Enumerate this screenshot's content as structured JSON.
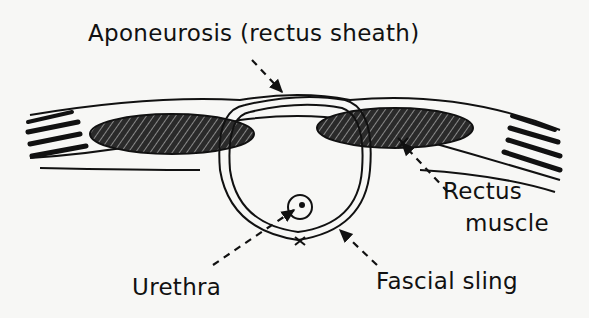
{
  "diagram": {
    "type": "anatomical-illustration",
    "labels": {
      "aponeurosis": "Aponeurosis (rectus sheath)",
      "rectus_line1": "Rectus",
      "rectus_line2": "muscle",
      "urethra": "Urethra",
      "fascial_sling": "Fascial sling"
    },
    "colors": {
      "ink": "#111111",
      "background": "#f7f7f5"
    }
  }
}
